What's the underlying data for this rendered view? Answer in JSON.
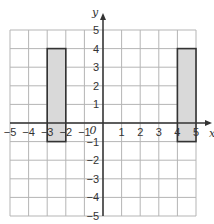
{
  "chart_data": {
    "type": "diagram",
    "title": "",
    "xlabel": "x",
    "ylabel": "y",
    "origin_label": "0",
    "xlim": [
      -5,
      5
    ],
    "ylim": [
      -5,
      5
    ],
    "grid": true,
    "x_ticks": [
      "-5",
      "-4",
      "-3",
      "-2",
      "-1",
      "1",
      "2",
      "3",
      "4",
      "5"
    ],
    "y_ticks": [
      "5",
      "4",
      "3",
      "2",
      "1",
      "-1",
      "-2",
      "-3",
      "-4",
      "-5"
    ],
    "shapes": [
      {
        "name": "rectangle-left",
        "x": [
          -3,
          -2
        ],
        "y": [
          -1,
          4
        ],
        "fill": "#d9d9d9"
      },
      {
        "name": "rectangle-right",
        "x": [
          4,
          5
        ],
        "y": [
          -1,
          4
        ],
        "fill": "#d9d9d9"
      }
    ]
  }
}
